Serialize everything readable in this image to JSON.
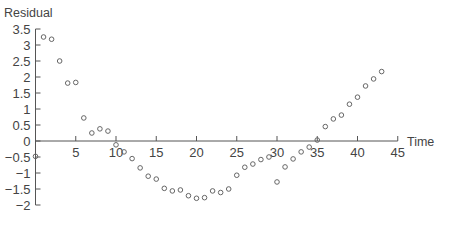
{
  "chart_data": {
    "type": "scatter",
    "title": "",
    "xlabel": "Time",
    "ylabel": "Residual",
    "xlim": [
      0,
      45
    ],
    "ylim": [
      -2,
      3.5
    ],
    "xticks": [
      5,
      10,
      15,
      20,
      25,
      30,
      35,
      40,
      45
    ],
    "yticks": [
      3.5,
      3,
      2.5,
      2,
      1.5,
      1,
      0.5,
      0,
      -0.5,
      -1,
      -1.5,
      -2
    ],
    "grid": false,
    "legend": null,
    "series": [
      {
        "name": "Residual",
        "marker": "open-circle",
        "x": [
          0,
          1,
          2,
          3,
          4,
          5,
          6,
          7,
          8,
          9,
          10,
          11,
          12,
          13,
          14,
          15,
          16,
          17,
          18,
          19,
          20,
          21,
          22,
          23,
          24,
          25,
          26,
          27,
          28,
          29,
          30,
          31,
          32,
          33,
          34,
          35,
          36,
          37,
          38,
          39,
          40,
          41,
          42,
          43
        ],
        "y": [
          -0.48,
          3.25,
          3.18,
          2.5,
          1.81,
          1.83,
          0.72,
          0.25,
          0.38,
          0.31,
          -0.12,
          -0.34,
          -0.55,
          -0.84,
          -1.1,
          -1.19,
          -1.48,
          -1.56,
          -1.53,
          -1.71,
          -1.79,
          -1.77,
          -1.56,
          -1.61,
          -1.5,
          -1.07,
          -0.82,
          -0.72,
          -0.58,
          -0.5,
          -1.28,
          -0.81,
          -0.56,
          -0.34,
          -0.19,
          0.03,
          0.45,
          0.69,
          0.81,
          1.15,
          1.37,
          1.72,
          1.94,
          2.17
        ]
      }
    ]
  }
}
